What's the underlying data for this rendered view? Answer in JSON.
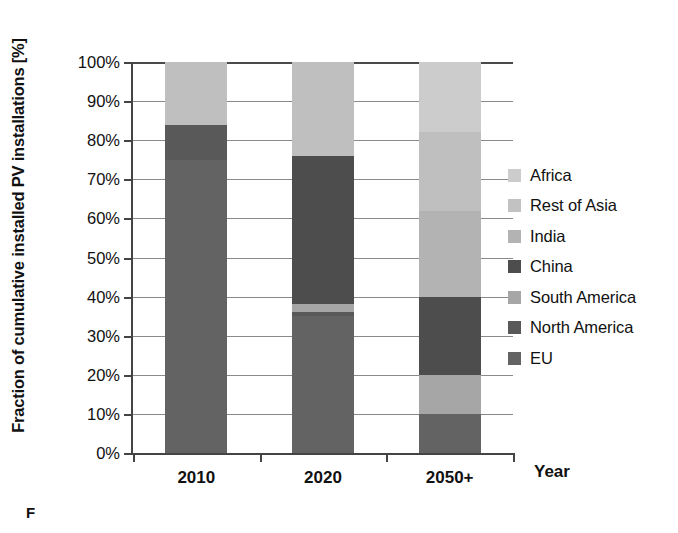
{
  "chart_data": {
    "type": "bar",
    "subtype": "stacked-bar-100-percent",
    "title": "",
    "xlabel": "Year",
    "ylabel": "Fraction of cumulative installed PV installations [%]",
    "ylim": [
      0,
      100
    ],
    "ytick_labels": [
      "0%",
      "10%",
      "20%",
      "30%",
      "40%",
      "50%",
      "60%",
      "70%",
      "80%",
      "90%",
      "100%"
    ],
    "ytick_values": [
      0,
      10,
      20,
      30,
      40,
      50,
      60,
      70,
      80,
      90,
      100
    ],
    "grid": true,
    "grid_axis": "y",
    "legend_position": "right",
    "categories": [
      "2010",
      "2020",
      "2050+"
    ],
    "stack_order_bottom_to_top": [
      "EU",
      "North America",
      "South America",
      "China",
      "India",
      "Rest of Asia",
      "Africa"
    ],
    "series": [
      {
        "name": "EU",
        "color": "#636363",
        "values": [
          75,
          35,
          10
        ]
      },
      {
        "name": "North America",
        "color": "#595959",
        "values": [
          9,
          1,
          0
        ]
      },
      {
        "name": "South America",
        "color": "#a6a6a6",
        "values": [
          0,
          2,
          10
        ]
      },
      {
        "name": "China",
        "color": "#4d4d4d",
        "values": [
          0,
          38,
          20
        ]
      },
      {
        "name": "India",
        "color": "#b3b3b3",
        "values": [
          0,
          0,
          22
        ]
      },
      {
        "name": "Rest of Asia",
        "color": "#bfbfbf",
        "values": [
          16,
          24,
          20
        ]
      },
      {
        "name": "Africa",
        "color": "#cccccc",
        "values": [
          0,
          0,
          18
        ]
      }
    ],
    "annotations": []
  },
  "legend": {
    "items": [
      {
        "label": "Africa",
        "color": "#cccccc"
      },
      {
        "label": "Rest of Asia",
        "color": "#c2c2c2"
      },
      {
        "label": "India",
        "color": "#b3b3b3"
      },
      {
        "label": "China",
        "color": "#4d4d4d"
      },
      {
        "label": "South America",
        "color": "#a6a6a6"
      },
      {
        "label": "North America",
        "color": "#595959"
      },
      {
        "label": "EU",
        "color": "#636363"
      }
    ]
  },
  "axes": {
    "y_title": "Fraction of cumulative installed PV installations [%]",
    "x_title": "Year",
    "y_ticks": [
      "100%",
      "90%",
      "80%",
      "70%",
      "60%",
      "50%",
      "40%",
      "30%",
      "20%",
      "10%",
      "0%"
    ],
    "x_ticks": [
      "2010",
      "2020",
      "2050+"
    ]
  },
  "caption": {
    "text": "F"
  },
  "palette": {
    "axis": "#444444",
    "gridline": "#8a8a8a",
    "text": "#111111",
    "background": "#ffffff"
  }
}
